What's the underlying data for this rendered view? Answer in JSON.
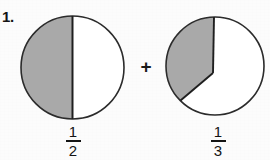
{
  "worksheet": {
    "item_number": "1.",
    "top_clipped_text": "",
    "operator": "+",
    "colors": {
      "shade_fill": "#a9a9a9",
      "outline": "#2b2b2b",
      "unshaded_fill": "#ffffff",
      "text": "#141414",
      "page_background": "#fcfcfc"
    }
  },
  "figures": [
    {
      "name": "half-circle-model",
      "fraction": {
        "numerator": "1",
        "denominator": "2"
      },
      "circle": {
        "cx": 72.5,
        "cy": 67.5,
        "r": 51.5
      },
      "shaded_description": "left half shaded",
      "shaded_fraction_value": 0.5,
      "divider": "vertical diameter"
    },
    {
      "name": "third-circle-model",
      "fraction": {
        "numerator": "1",
        "denominator": "3"
      },
      "circle": {
        "cx": 215,
        "cy": 66,
        "r": 49
      },
      "shaded_description": "one third shaded, vertex offset from center",
      "shaded_fraction_value": 0.3333,
      "vertex": {
        "x": 213,
        "y": 73
      },
      "arc_start": {
        "x": 214,
        "y": 17
      },
      "arc_end": {
        "x": 180,
        "y": 100
      }
    }
  ]
}
